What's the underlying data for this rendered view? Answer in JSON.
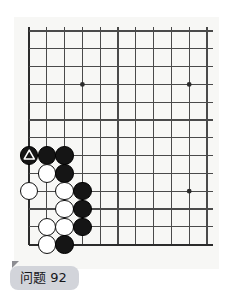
{
  "board": {
    "name": "go-board",
    "columns": 11,
    "rows": 13,
    "origin_x": 15,
    "origin_y": 14,
    "spacing": 17.8,
    "line_color": "#4a4a4a",
    "edge_color": "#2b2b2b",
    "background_color": "#f7f7f5",
    "star_points": [
      {
        "col": 3,
        "row": 3
      },
      {
        "col": 9,
        "row": 3
      },
      {
        "col": 9,
        "row": 9
      }
    ],
    "stones": [
      {
        "col": 0,
        "row": 7,
        "color": "black",
        "mark": "triangle"
      },
      {
        "col": 1,
        "row": 7,
        "color": "black",
        "mark": ""
      },
      {
        "col": 2,
        "row": 7,
        "color": "black",
        "mark": ""
      },
      {
        "col": 1,
        "row": 8,
        "color": "white",
        "mark": ""
      },
      {
        "col": 2,
        "row": 8,
        "color": "black",
        "mark": ""
      },
      {
        "col": 0,
        "row": 9,
        "color": "white",
        "mark": ""
      },
      {
        "col": 2,
        "row": 9,
        "color": "white",
        "mark": ""
      },
      {
        "col": 3,
        "row": 9,
        "color": "black",
        "mark": ""
      },
      {
        "col": 2,
        "row": 10,
        "color": "white",
        "mark": ""
      },
      {
        "col": 3,
        "row": 10,
        "color": "black",
        "mark": ""
      },
      {
        "col": 1,
        "row": 11,
        "color": "white",
        "mark": ""
      },
      {
        "col": 2,
        "row": 11,
        "color": "white",
        "mark": ""
      },
      {
        "col": 3,
        "row": 11,
        "color": "black",
        "mark": ""
      },
      {
        "col": 1,
        "row": 12,
        "color": "white",
        "mark": ""
      },
      {
        "col": 2,
        "row": 12,
        "color": "black",
        "mark": ""
      }
    ],
    "stone_colors": {
      "black_fill": "#151515",
      "white_fill": "#ffffff",
      "stone_outline": "#111111",
      "mark_color": "#ffffff"
    }
  },
  "caption": {
    "label": "问题 92",
    "background_color": "#d2d4da",
    "text_color": "#17171a"
  }
}
